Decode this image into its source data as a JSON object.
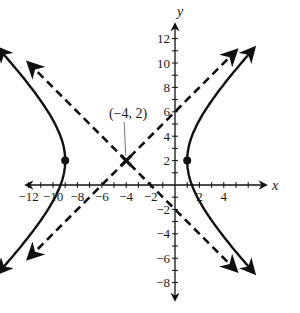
{
  "chart_data": {
    "type": "line",
    "title": "",
    "xlabel": "x",
    "ylabel": "y",
    "xlim": [
      -14,
      6
    ],
    "ylim": [
      -9,
      13
    ],
    "grid": false,
    "x_ticks": [
      -12,
      -10,
      -8,
      -6,
      -4,
      -2,
      2,
      4
    ],
    "x_tick_labels": [
      "−12",
      "−10",
      "−8",
      "−6",
      "−4",
      "−2",
      "2",
      "4"
    ],
    "y_ticks": [
      12,
      10,
      8,
      6,
      4,
      2,
      -2,
      -4,
      -6,
      -8
    ],
    "y_tick_labels": [
      "12",
      "10",
      "8",
      "6",
      "4",
      "2",
      "−2",
      "−4",
      "−6",
      "−8"
    ],
    "series": [
      {
        "name": "hyperbola",
        "style": "solid",
        "equation": "(x+4)^2/25 - (y-2)^2/25 = 1",
        "center": [
          -4,
          2
        ],
        "vertices": [
          [
            -9,
            2
          ],
          [
            1,
            2
          ]
        ]
      },
      {
        "name": "asymptote-1",
        "style": "dashed",
        "equation": "y = x + 6",
        "points": [
          [
            -14,
            -8
          ],
          [
            6,
            12
          ]
        ]
      },
      {
        "name": "asymptote-2",
        "style": "dashed",
        "equation": "y = -x - 2",
        "points": [
          [
            -14,
            12
          ],
          [
            6,
            -8
          ]
        ]
      }
    ],
    "points": [
      {
        "name": "center",
        "x": -4,
        "y": 2,
        "marker": "x"
      },
      {
        "name": "left-vertex",
        "x": -9,
        "y": 2,
        "marker": "dot"
      },
      {
        "name": "right-vertex",
        "x": 1,
        "y": 2,
        "marker": "dot"
      }
    ],
    "annotations": [
      {
        "text": "(−4, 2)",
        "x": -4,
        "y": 2
      }
    ]
  }
}
